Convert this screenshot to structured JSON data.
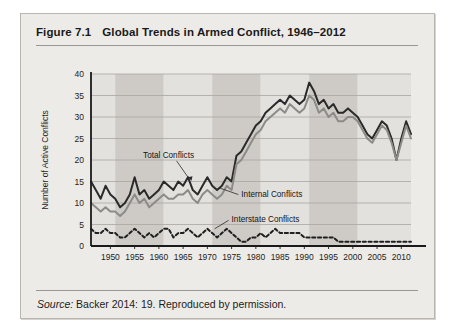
{
  "figure": {
    "number": "Figure 7.1",
    "title": "Global Trends in Armed Conflict, 1946–2012",
    "source": "Backer 2014: 19. Reproduced by permission.",
    "source_prefix": "Source:"
  },
  "colors": {
    "card_background": "#edebe7",
    "card_border": "#b9b6b1",
    "plot_band_light": "#e3e1dd",
    "plot_band_dark": "#cecbc6",
    "gridline": "#a9a6a1",
    "axis": "#1a1a1a",
    "total": "#2a2a2a",
    "internal": "#8d8b88",
    "interstate": "#1f1f1f"
  },
  "chart_data": {
    "type": "line",
    "title": "Global Trends in Armed Conflict, 1946–2012",
    "xlabel": "",
    "ylabel": "Number of Active Conflicts",
    "xlim": [
      1946,
      2012
    ],
    "ylim": [
      0,
      40
    ],
    "ytick_step": 5,
    "yticks": [
      0,
      5,
      10,
      15,
      20,
      25,
      30,
      35,
      40
    ],
    "xticks": [
      1950,
      1955,
      1960,
      1965,
      1970,
      1975,
      1980,
      1985,
      1990,
      1995,
      2000,
      2005,
      2010
    ],
    "grid": "horizontal",
    "legend": "inline-annotations",
    "bands": [
      {
        "from": 1946,
        "to": 1951,
        "shade": "light"
      },
      {
        "from": 1951,
        "to": 1961,
        "shade": "dark"
      },
      {
        "from": 1961,
        "to": 1971,
        "shade": "light"
      },
      {
        "from": 1971,
        "to": 1981,
        "shade": "dark"
      },
      {
        "from": 1981,
        "to": 1991,
        "shade": "light"
      },
      {
        "from": 1991,
        "to": 2001,
        "shade": "dark"
      },
      {
        "from": 2001,
        "to": 2012,
        "shade": "light"
      }
    ],
    "x": [
      1946,
      1947,
      1948,
      1949,
      1950,
      1951,
      1952,
      1953,
      1954,
      1955,
      1956,
      1957,
      1958,
      1959,
      1960,
      1961,
      1962,
      1963,
      1964,
      1965,
      1966,
      1967,
      1968,
      1969,
      1970,
      1971,
      1972,
      1973,
      1974,
      1975,
      1976,
      1977,
      1978,
      1979,
      1980,
      1981,
      1982,
      1983,
      1984,
      1985,
      1986,
      1987,
      1988,
      1989,
      1990,
      1991,
      1992,
      1993,
      1994,
      1995,
      1996,
      1997,
      1998,
      1999,
      2000,
      2001,
      2002,
      2003,
      2004,
      2005,
      2006,
      2007,
      2008,
      2009,
      2010,
      2011,
      2012
    ],
    "series": [
      {
        "name": "Total Conflicts",
        "style": "solid-dark",
        "values": [
          15,
          13,
          11,
          14,
          12,
          11,
          9,
          10,
          12,
          16,
          12,
          13,
          11,
          12,
          13,
          15,
          14,
          13,
          15,
          14,
          16,
          13,
          12,
          14,
          16,
          14,
          13,
          14,
          16,
          15,
          21,
          22,
          24,
          26,
          28,
          29,
          31,
          32,
          33,
          34,
          33,
          35,
          34,
          33,
          34,
          38,
          36,
          33,
          34,
          32,
          33,
          31,
          31,
          32,
          31,
          30,
          28,
          26,
          25,
          27,
          29,
          28,
          25,
          20,
          25,
          29,
          26
        ]
      },
      {
        "name": "Internal Conflicts",
        "style": "solid-gray",
        "values": [
          10,
          9,
          8,
          9,
          8,
          8,
          7,
          8,
          10,
          12,
          10,
          11,
          9,
          10,
          11,
          12,
          11,
          11,
          12,
          12,
          13,
          11,
          10,
          12,
          13,
          12,
          11,
          12,
          14,
          13,
          19,
          20,
          22,
          24,
          26,
          27,
          29,
          30,
          31,
          32,
          31,
          33,
          32,
          31,
          32,
          35,
          34,
          31,
          32,
          30,
          31,
          29,
          29,
          30,
          30,
          29,
          27,
          25,
          24,
          26,
          28,
          27,
          24,
          20,
          24,
          28,
          25
        ]
      },
      {
        "name": "Interstate Conflicts",
        "style": "dotted-dark",
        "values": [
          4,
          3,
          3,
          4,
          3,
          3,
          2,
          2,
          3,
          4,
          3,
          2,
          3,
          2,
          3,
          4,
          4,
          2,
          3,
          3,
          4,
          3,
          2,
          3,
          4,
          3,
          2,
          3,
          4,
          3,
          2,
          1,
          1,
          2,
          2,
          3,
          2,
          3,
          4,
          3,
          3,
          3,
          3,
          3,
          2,
          2,
          2,
          2,
          2,
          2,
          2,
          1,
          1,
          1,
          1,
          1,
          1,
          1,
          1,
          1,
          1,
          1,
          1,
          1,
          1,
          1,
          1
        ]
      }
    ],
    "annotations": [
      {
        "text": "Total Conflicts",
        "x": 1962,
        "y": 20.5
      },
      {
        "text": "Internal Conflicts",
        "x": 1977,
        "y": 11.5
      },
      {
        "text": "Interstate Conflicts",
        "x": 1975,
        "y": 5.5
      }
    ]
  }
}
